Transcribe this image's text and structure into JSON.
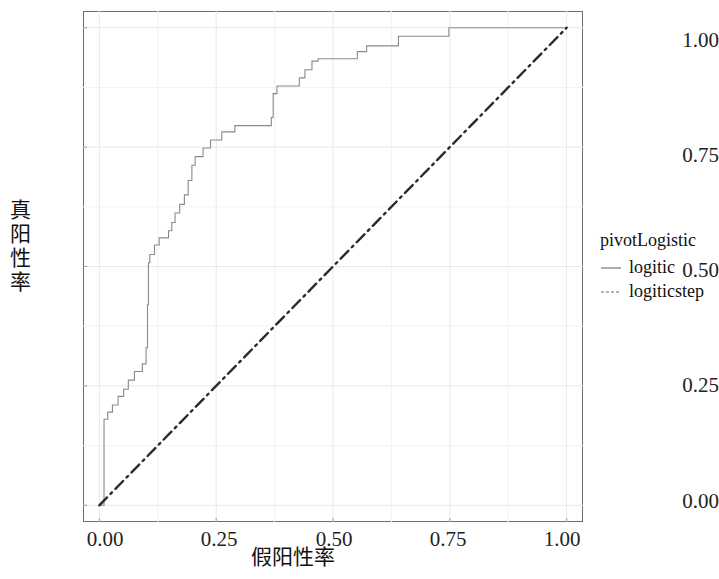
{
  "chart_data": {
    "type": "line",
    "title": "",
    "subtitle": "",
    "xlabel": "假阳性率",
    "ylabel": "真阳性率",
    "xlim": [
      -0.035,
      1.035
    ],
    "ylim": [
      -0.035,
      1.035
    ],
    "xticks": [
      0.0,
      0.25,
      0.5,
      0.75,
      1.0
    ],
    "xticklabels": [
      "0.00",
      "0.25",
      "0.50",
      "0.75",
      "1.00"
    ],
    "yticks": [
      0.0,
      0.25,
      0.5,
      0.75,
      1.0
    ],
    "yticklabels": [
      "0.00",
      "0.25",
      "0.50",
      "0.75",
      "1.00"
    ],
    "grid": true,
    "grid_color": "#e9e9e9",
    "minor_grid": true,
    "legend_position": "right",
    "legend_title": "pivotLogistic",
    "series": [
      {
        "name": "logitic",
        "style": "solid",
        "color": "#8a8a8a",
        "width": 1.1,
        "points": [
          [
            0.0,
            0.0
          ],
          [
            0.01,
            0.0
          ],
          [
            0.01,
            0.18
          ],
          [
            0.018,
            0.18
          ],
          [
            0.018,
            0.195
          ],
          [
            0.028,
            0.195
          ],
          [
            0.028,
            0.21
          ],
          [
            0.04,
            0.21
          ],
          [
            0.04,
            0.228
          ],
          [
            0.052,
            0.228
          ],
          [
            0.052,
            0.243
          ],
          [
            0.062,
            0.243
          ],
          [
            0.062,
            0.262
          ],
          [
            0.075,
            0.262
          ],
          [
            0.075,
            0.28
          ],
          [
            0.092,
            0.28
          ],
          [
            0.092,
            0.296
          ],
          [
            0.1,
            0.296
          ],
          [
            0.1,
            0.33
          ],
          [
            0.103,
            0.33
          ],
          [
            0.103,
            0.42
          ],
          [
            0.105,
            0.42
          ],
          [
            0.105,
            0.508
          ],
          [
            0.108,
            0.508
          ],
          [
            0.108,
            0.525
          ],
          [
            0.118,
            0.525
          ],
          [
            0.118,
            0.545
          ],
          [
            0.128,
            0.545
          ],
          [
            0.128,
            0.56
          ],
          [
            0.148,
            0.56
          ],
          [
            0.148,
            0.575
          ],
          [
            0.155,
            0.575
          ],
          [
            0.155,
            0.592
          ],
          [
            0.162,
            0.592
          ],
          [
            0.162,
            0.612
          ],
          [
            0.172,
            0.612
          ],
          [
            0.172,
            0.63
          ],
          [
            0.182,
            0.63
          ],
          [
            0.182,
            0.65
          ],
          [
            0.19,
            0.65
          ],
          [
            0.19,
            0.68
          ],
          [
            0.198,
            0.68
          ],
          [
            0.198,
            0.712
          ],
          [
            0.205,
            0.712
          ],
          [
            0.205,
            0.73
          ],
          [
            0.222,
            0.73
          ],
          [
            0.222,
            0.748
          ],
          [
            0.238,
            0.748
          ],
          [
            0.238,
            0.765
          ],
          [
            0.262,
            0.765
          ],
          [
            0.262,
            0.782
          ],
          [
            0.29,
            0.782
          ],
          [
            0.29,
            0.795
          ],
          [
            0.368,
            0.795
          ],
          [
            0.368,
            0.812
          ],
          [
            0.372,
            0.812
          ],
          [
            0.372,
            0.862
          ],
          [
            0.38,
            0.862
          ],
          [
            0.38,
            0.878
          ],
          [
            0.428,
            0.878
          ],
          [
            0.428,
            0.895
          ],
          [
            0.44,
            0.895
          ],
          [
            0.44,
            0.912
          ],
          [
            0.455,
            0.912
          ],
          [
            0.455,
            0.93
          ],
          [
            0.468,
            0.93
          ],
          [
            0.468,
            0.935
          ],
          [
            0.552,
            0.935
          ],
          [
            0.552,
            0.95
          ],
          [
            0.572,
            0.95
          ],
          [
            0.572,
            0.962
          ],
          [
            0.64,
            0.962
          ],
          [
            0.64,
            0.982
          ],
          [
            0.748,
            0.982
          ],
          [
            0.748,
            1.0
          ],
          [
            1.0,
            1.0
          ]
        ]
      },
      {
        "name": "logiticstep",
        "style": "dashdot",
        "color": "#2b2b2b",
        "width": 2.4,
        "points": [
          [
            0.0,
            0.0
          ],
          [
            1.0,
            1.0
          ]
        ]
      }
    ],
    "annotations": []
  },
  "axes": {
    "y_title": "真阳性率",
    "x_title": "假阳性率",
    "y_tick_labels": [
      "1.00",
      "0.75",
      "0.50",
      "0.25",
      "0.00"
    ],
    "x_tick_labels": [
      "0.00",
      "0.25",
      "0.50",
      "0.75",
      "1.00"
    ]
  },
  "legend": {
    "title": "pivotLogistic",
    "items": [
      {
        "label": "logitic",
        "style": "solid"
      },
      {
        "label": "logiticstep",
        "style": "dashed"
      }
    ]
  }
}
